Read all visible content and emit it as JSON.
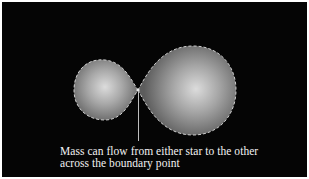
{
  "diagram": {
    "type": "roche-lobe-binary-star",
    "background_color": "#050505",
    "lobe_fill_center": "#d8d8d8",
    "lobe_fill_edge": "#6a6a6a",
    "outline_color": "#cfcfcf",
    "outline_style": "dashed",
    "left_lobe": {
      "label": "smaller star"
    },
    "right_lobe": {
      "label": "larger star"
    },
    "contact_point": {
      "label": "boundary point"
    }
  },
  "caption": {
    "line1": "Mass can flow from either star to the other",
    "line2": "across the boundary point"
  }
}
